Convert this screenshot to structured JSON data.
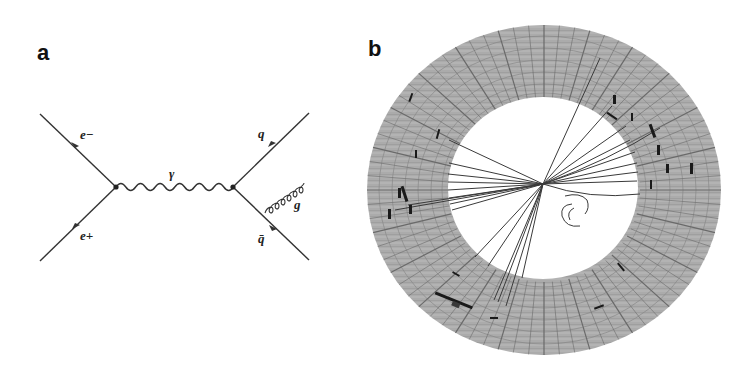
{
  "panels": {
    "a": {
      "label": "a",
      "title": "Feynman diagram",
      "particles": {
        "electron": "e−",
        "positron": "e+",
        "photon": "γ",
        "quark": "q",
        "antiquark": "q̄",
        "gluon": "g"
      },
      "colors": {
        "line": "#333333",
        "background": "#ffffff"
      }
    },
    "b": {
      "label": "b",
      "title": "Detector event display",
      "colors": {
        "detector_fill": "#a9a9a9",
        "grid": "#6e6e6e",
        "tracks": "#333333",
        "hits": "#111111",
        "inner": "#ffffff"
      }
    }
  }
}
